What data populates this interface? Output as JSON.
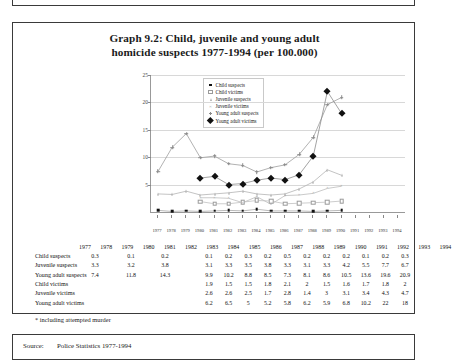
{
  "figure": {
    "title_line1": "Graph 9.2: Child, juvenile and young adult",
    "title_line2": "homicide suspects 1977-1994 (per 100.000)",
    "footnote": "* including attempted murder",
    "source_label": "Source:",
    "source_text": "Police Statistics 1977-1994"
  },
  "legend": {
    "position": "top-left-inside",
    "items": [
      {
        "label": "Child suspects",
        "marker": "square-filled"
      },
      {
        "label": "Child victims",
        "marker": "square-open"
      },
      {
        "label": "Juvenile suspects",
        "marker": "triangle"
      },
      {
        "label": "Juvenile victims",
        "marker": "x"
      },
      {
        "label": "Young adult suspects",
        "marker": "plus"
      },
      {
        "label": "Young adult victims",
        "marker": "diamond-filled"
      }
    ]
  },
  "chart_data": {
    "type": "line",
    "title": "Graph 9.2: Child, juvenile and young adult homicide suspects 1977-1994 (per 100.000)",
    "xlabel": "",
    "ylabel": "",
    "ylim": [
      0,
      25
    ],
    "yticks": [
      5,
      10,
      15,
      20,
      25
    ],
    "grid": true,
    "legend_position": "inside top-left",
    "x": [
      1977,
      1978,
      1979,
      1980,
      1981,
      1982,
      1983,
      1984,
      1985,
      1986,
      1987,
      1988,
      1989,
      1990,
      1991,
      1992,
      1993,
      1994
    ],
    "categories": [
      "1977",
      "1978",
      "1979",
      "1980",
      "1981",
      "1982",
      "1983",
      "1984",
      "1985",
      "1986",
      "1987",
      "1988",
      "1989",
      "1990",
      "1991",
      "1992",
      "1993",
      "1994"
    ],
    "series": [
      {
        "name": "Child suspects",
        "marker": "square-filled",
        "values": [
          0.3,
          0.1,
          0.2,
          0.1,
          0.2,
          0.3,
          0.2,
          0.5,
          0.2,
          0.2,
          0.2,
          0.1,
          0.2,
          0.3,
          null,
          null,
          null,
          null
        ]
      },
      {
        "name": "Juvenile suspects",
        "marker": "triangle",
        "values": [
          3.3,
          3.2,
          3.8,
          3.1,
          3.3,
          3.5,
          3.8,
          3.3,
          3.1,
          3.3,
          4.2,
          5.5,
          7.7,
          6.7,
          null,
          null,
          null,
          null
        ]
      },
      {
        "name": "Young adult suspects",
        "marker": "plus",
        "values": [
          7.4,
          11.8,
          14.3,
          9.9,
          10.2,
          8.8,
          8.5,
          7.3,
          8.1,
          8.6,
          10.5,
          13.6,
          19.6,
          20.9,
          null,
          null,
          null,
          null
        ]
      },
      {
        "name": "Child victims",
        "marker": "square-open",
        "values": [
          null,
          null,
          null,
          1.9,
          1.5,
          1.5,
          1.8,
          2.1,
          2,
          1.5,
          1.6,
          1.7,
          1.8,
          2,
          null,
          null,
          null,
          null
        ]
      },
      {
        "name": "Juvenile victims",
        "marker": "x",
        "values": [
          null,
          null,
          null,
          2.6,
          2.6,
          2.5,
          1.7,
          2.8,
          1.4,
          3,
          3.1,
          3.4,
          4.3,
          4.7,
          null,
          null,
          null,
          null
        ]
      },
      {
        "name": "Young adult victims",
        "marker": "diamond-filled",
        "values": [
          null,
          null,
          null,
          6.2,
          6.5,
          5,
          5.2,
          5.8,
          6.2,
          5.9,
          6.8,
          10.2,
          22,
          18,
          null,
          null,
          null,
          null
        ]
      }
    ]
  },
  "table": {
    "years": [
      "1977",
      "1978",
      "1979",
      "1980",
      "1981",
      "1982",
      "1983",
      "1984",
      "1985",
      "1986",
      "1987",
      "1988",
      "1989",
      "1990",
      "1991",
      "1992",
      "1993",
      "1994"
    ],
    "rows": [
      {
        "label": "Child suspects",
        "values": [
          "0.3",
          "0.1",
          "0.2",
          "0.1",
          "0.2",
          "0.3",
          "0.2",
          "0.5",
          "0.2",
          "0.2",
          "0.2",
          "0.1",
          "0.2",
          "0.3"
        ]
      },
      {
        "label": "Juvenile suspects",
        "values": [
          "3.3",
          "3.2",
          "3.8",
          "3.1",
          "3.3",
          "3.5",
          "3.8",
          "3.3",
          "3.1",
          "3.3",
          "4.2",
          "5.5",
          "7.7",
          "6.7"
        ]
      },
      {
        "label": "Young adult suspects",
        "values": [
          "7.4",
          "11.8",
          "14.3",
          "9.9",
          "10.2",
          "8.8",
          "8.5",
          "7.3",
          "8.1",
          "8.6",
          "10.5",
          "13.6",
          "19.6",
          "20.9"
        ]
      },
      {
        "label": "Child victims",
        "values": [
          "",
          "",
          "",
          "1.9",
          "1.5",
          "1.5",
          "1.8",
          "2.1",
          "2",
          "1.5",
          "1.6",
          "1.7",
          "1.8",
          "2"
        ]
      },
      {
        "label": "Juvenile victims",
        "values": [
          "",
          "",
          "",
          "2.6",
          "2.6",
          "2.5",
          "1.7",
          "2.8",
          "1.4",
          "3",
          "3.1",
          "3.4",
          "4.3",
          "4.7"
        ]
      },
      {
        "label": "Young adult victims",
        "values": [
          "",
          "",
          "",
          "6.2",
          "6.5",
          "5",
          "5.2",
          "5.8",
          "6.2",
          "5.9",
          "6.8",
          "10.2",
          "22",
          "18"
        ]
      }
    ]
  }
}
